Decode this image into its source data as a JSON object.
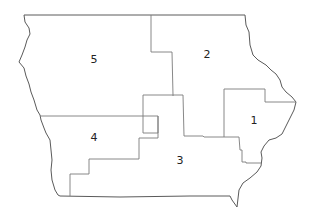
{
  "map": {
    "title": "",
    "region": "Iowa congressional districts",
    "colors": {
      "boundary": "#5a5a5a",
      "district_line": "#7a7a7a",
      "label": "#222222",
      "background": "#ffffff"
    },
    "districts": [
      {
        "id": "1",
        "label": "1"
      },
      {
        "id": "2",
        "label": "2"
      },
      {
        "id": "3",
        "label": "3"
      },
      {
        "id": "4",
        "label": "4"
      },
      {
        "id": "5",
        "label": "5"
      }
    ]
  }
}
